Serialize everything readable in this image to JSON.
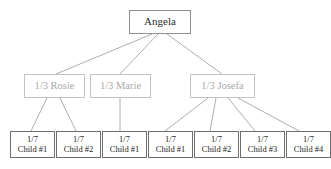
{
  "diagram": {
    "type": "inheritance-tree",
    "title_node": {
      "label": "Angela"
    },
    "generation2": [
      {
        "share": "1/3",
        "name": "Rosie",
        "label": "1/3 Rosie"
      },
      {
        "share": "1/3",
        "name": "Marie",
        "label": "1/3 Marie"
      },
      {
        "share": "1/3",
        "name": "Josefa",
        "label": "1/3 Josefa"
      }
    ],
    "generation3": [
      {
        "share": "1/7",
        "label": "Child #1",
        "parent": "Rosie"
      },
      {
        "share": "1/7",
        "label": "Child #2",
        "parent": "Rosie"
      },
      {
        "share": "1/7",
        "label": "Child #1",
        "parent": "Marie"
      },
      {
        "share": "1/7",
        "label": "Child #1",
        "parent": "Josefa"
      },
      {
        "share": "1/7",
        "label": "Child #2",
        "parent": "Josefa"
      },
      {
        "share": "1/7",
        "label": "Child #3",
        "parent": "Josefa"
      },
      {
        "share": "1/7",
        "label": "Child #4",
        "parent": "Josefa"
      }
    ],
    "colors": {
      "background": "#ffffff",
      "root_border": "#8f8f8f",
      "root_text": "#2b2b2b",
      "mid_border": "#c4c4c4",
      "mid_text": "#a9a9a9",
      "leaf_border": "#6e6e6e",
      "leaf_text": "#1d1d1d",
      "edge": "#999999"
    }
  }
}
